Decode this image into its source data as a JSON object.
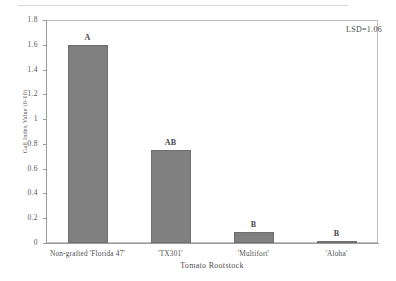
{
  "chart_data": {
    "type": "bar",
    "title": "",
    "categories": [
      "Non-grafted 'Florida 47'",
      "'TX301'",
      "'Multifort'",
      "'Aloha'"
    ],
    "values": [
      1.6,
      0.75,
      0.09,
      0.02
    ],
    "point_labels": [
      "A",
      "AB",
      "B",
      "B"
    ],
    "xlabel": "Tomato Rootstock",
    "ylabel": "Gall Index Value (0-10)",
    "ylim": [
      0,
      1.8
    ],
    "ytick_labels": [
      "0",
      "0.2",
      "0.4",
      "0.6",
      "0.8",
      "1",
      "1.2",
      "1.4",
      "1.6",
      "1.8"
    ],
    "ytick_values": [
      0,
      0.2,
      0.4,
      0.6,
      0.8,
      1.0,
      1.2,
      1.4,
      1.6,
      1.8
    ],
    "grid": false,
    "legend": null,
    "annotations": [
      {
        "text": "LSD=1.06",
        "position": "top-right"
      }
    ],
    "bar_color": "#808080",
    "frame_color": "#bfbfbf",
    "axis_color": "#9a9a9a"
  }
}
